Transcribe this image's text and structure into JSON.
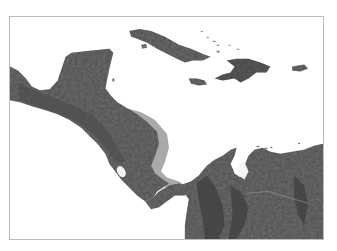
{
  "map": {
    "type": "shaded relief map",
    "region": "Central America and the Caribbean",
    "colors": {
      "sea": "#ffffff",
      "land": "#6e6e6e",
      "land_dark": "#4a4a4a",
      "lowland_shelf": "#a9a9a9",
      "frame_border": "#bdbdbd"
    },
    "features": [
      {
        "id": "mexico-yucatan",
        "label": "Yucatán Peninsula"
      },
      {
        "id": "central-america-isthmus",
        "label": "Central American isthmus"
      },
      {
        "id": "cuba",
        "label": "Cuba"
      },
      {
        "id": "jamaica",
        "label": "Jamaica"
      },
      {
        "id": "hispaniola",
        "label": "Hispaniola"
      },
      {
        "id": "puerto-rico",
        "label": "Puerto Rico"
      },
      {
        "id": "bahamas",
        "label": "Bahamas"
      },
      {
        "id": "lake-nicaragua",
        "label": "Lake Nicaragua"
      },
      {
        "id": "northern-south-america",
        "label": "Colombia / Venezuela"
      }
    ]
  }
}
